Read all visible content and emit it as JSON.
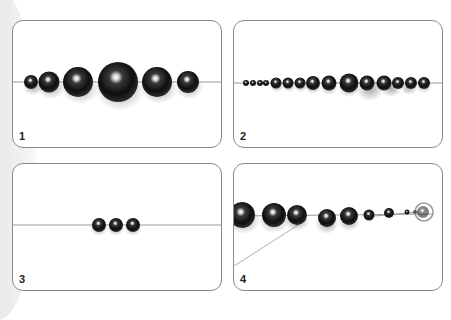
{
  "panels": [
    {
      "number": "1",
      "description": "Graduated strand of six round hematite beads, largest in the center, on a thread"
    },
    {
      "number": "2",
      "description": "Full graduated strand of beads on a thread, small beads at ends, largest in center"
    },
    {
      "number": "3",
      "description": "Three small beads strung together in the middle of a thread"
    },
    {
      "number": "4",
      "description": "Beads strung with thread end finished through a clasp/crimp at right"
    }
  ],
  "colors": {
    "panel_border": "#8a8a8a",
    "thread": "#9a9a9a",
    "bead": "#1a1a1a",
    "background": "#ffffff"
  }
}
